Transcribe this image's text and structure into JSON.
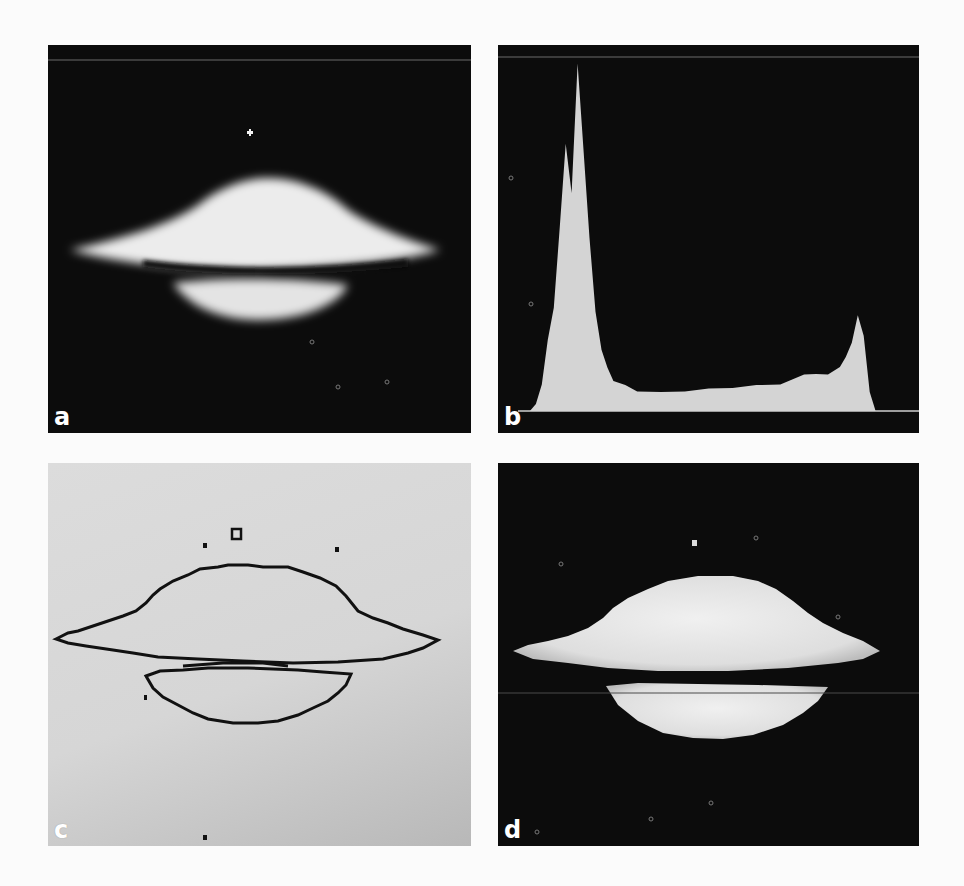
{
  "figure": {
    "panels": [
      {
        "id": "a",
        "label": "a",
        "content": "grayscale image of edge-on galaxy (dark background, bright bulge with dark dust lane)"
      },
      {
        "id": "b",
        "label": "b",
        "content": "gray-level histogram of image a"
      },
      {
        "id": "c",
        "label": "c",
        "content": "thresholded contour (edge) map on light background"
      },
      {
        "id": "d",
        "label": "d",
        "content": "segmented galaxy image after threshold"
      }
    ]
  },
  "colors": {
    "panel_dark_bg": "#0c0c0c",
    "panel_light_bg": "#d8d8d8",
    "histogram_fill": "#d4d4d4",
    "contour_line": "#111111",
    "label_color": "#ffffff",
    "page_bg": "#fbfbfb"
  },
  "chart_data": {
    "type": "bar",
    "title": "",
    "xlabel": "",
    "ylabel": "",
    "grid": false,
    "legend": "none",
    "xlim": [
      0,
      255
    ],
    "ylim": [
      0,
      100
    ],
    "x": [
      0,
      8,
      12,
      16,
      20,
      24,
      28,
      32,
      36,
      40,
      44,
      48,
      52,
      56,
      60,
      64,
      72,
      80,
      96,
      112,
      128,
      144,
      160,
      176,
      192,
      200,
      208,
      216,
      220,
      224,
      228,
      232,
      236,
      240,
      248,
      255
    ],
    "values": [
      0,
      0,
      2,
      8,
      20,
      30,
      52,
      77,
      62,
      100,
      74,
      50,
      28,
      18,
      12,
      9,
      7,
      6,
      5,
      6,
      6,
      7,
      7,
      8,
      10,
      11,
      10,
      13,
      15,
      20,
      27,
      22,
      5,
      0,
      0,
      0
    ]
  }
}
